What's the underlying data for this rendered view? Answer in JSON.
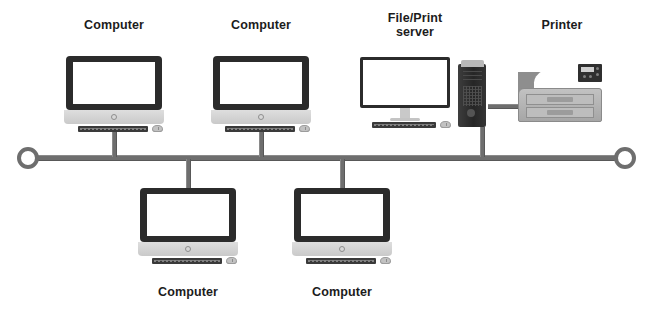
{
  "diagram": {
    "type": "network-topology",
    "colors": {
      "bus": "#6e6e6e",
      "bezel": "#2b2b2b",
      "screen": "#ffffff",
      "chassis": "#d2d2d2",
      "tower": "#2e2e2e",
      "printer": "#b0b0b0",
      "label_text": "#1c1c1c",
      "background": "#ffffff"
    },
    "backbone": {
      "name": "bus-backbone",
      "y": 157,
      "x_start": 28,
      "x_end": 625,
      "terminator_left": "ring-terminator",
      "terminator_right": "ring-terminator"
    },
    "nodes": [
      {
        "id": "computer-top-left",
        "label": "Computer",
        "device": "all-in-one-computer",
        "position": "above-bus",
        "drop_x": 114,
        "label_x": 114,
        "label_y": 18
      },
      {
        "id": "computer-top-middle",
        "label": "Computer",
        "device": "all-in-one-computer",
        "position": "above-bus",
        "drop_x": 261,
        "label_x": 261,
        "label_y": 18
      },
      {
        "id": "file-print-server",
        "label": "File/Print\nserver",
        "device": "monitor-and-tower",
        "position": "above-bus",
        "drop_x": 482,
        "label_x": 415,
        "label_y": 11
      },
      {
        "id": "printer",
        "label": "Printer",
        "device": "laser-printer",
        "position": "above-bus",
        "connected_to": "file-print-server",
        "label_x": 562,
        "label_y": 18
      },
      {
        "id": "computer-bottom-left",
        "label": "Computer",
        "device": "all-in-one-computer",
        "position": "below-bus",
        "drop_x": 188,
        "label_x": 188,
        "label_y": 285
      },
      {
        "id": "computer-bottom-right",
        "label": "Computer",
        "device": "all-in-one-computer",
        "position": "below-bus",
        "drop_x": 342,
        "label_x": 342,
        "label_y": 285
      }
    ]
  }
}
